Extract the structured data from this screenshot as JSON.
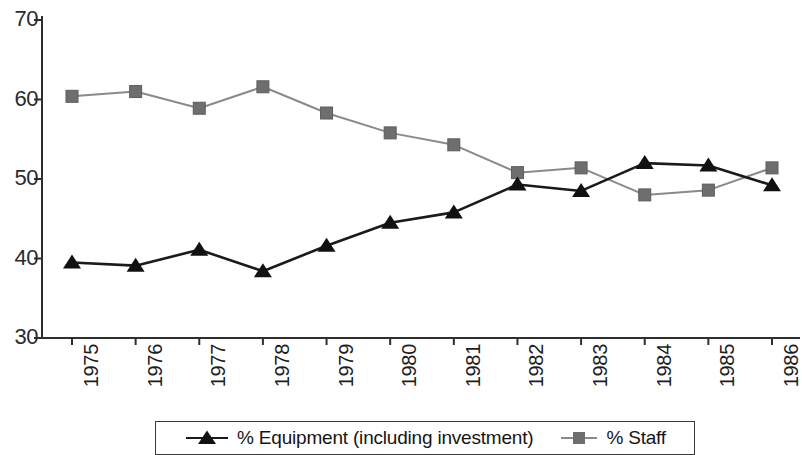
{
  "chart_data": {
    "type": "line",
    "title": "",
    "subtitle": "",
    "xlabel": "",
    "ylabel": "",
    "grid": false,
    "legend_position": "bottom",
    "categories": [
      "1975",
      "1976",
      "1977",
      "1978",
      "1979",
      "1980",
      "1981",
      "1982",
      "1983",
      "1984",
      "1985",
      "1986"
    ],
    "x": [
      1975,
      1976,
      1977,
      1978,
      1979,
      1980,
      1981,
      1982,
      1983,
      1984,
      1985,
      1986
    ],
    "ylim": [
      30,
      70
    ],
    "yticks": [
      30,
      40,
      50,
      60,
      70
    ],
    "ytick_labels": [
      "30",
      "40",
      "50",
      "60",
      "70"
    ],
    "series": [
      {
        "name": "% Equipment (including investment)",
        "color": "#1a1a1a",
        "marker": "triangle",
        "values": [
          39.5,
          39.1,
          41.1,
          38.4,
          41.6,
          44.5,
          45.8,
          49.3,
          48.5,
          52.0,
          51.7,
          49.2
        ]
      },
      {
        "name": "% Staff",
        "color": "#8a8a8a",
        "marker": "square",
        "values": [
          60.4,
          61.0,
          58.9,
          61.6,
          58.3,
          55.8,
          54.3,
          50.8,
          51.4,
          48.0,
          48.6,
          51.4
        ]
      }
    ]
  },
  "legend": {
    "entries": [
      {
        "label": "% Equipment (including investment)",
        "marker": "triangle-marker",
        "color": "#1a1a1a"
      },
      {
        "label": "% Staff",
        "marker": "square-marker",
        "color": "#8a8a8a"
      }
    ]
  },
  "axes": {
    "y_tick_labels": [
      "70",
      "60",
      "50",
      "40",
      "30"
    ],
    "x_tick_labels": [
      "1975",
      "1976",
      "1977",
      "1978",
      "1979",
      "1980",
      "1981",
      "1982",
      "1983",
      "1984",
      "1985",
      "1986"
    ]
  }
}
